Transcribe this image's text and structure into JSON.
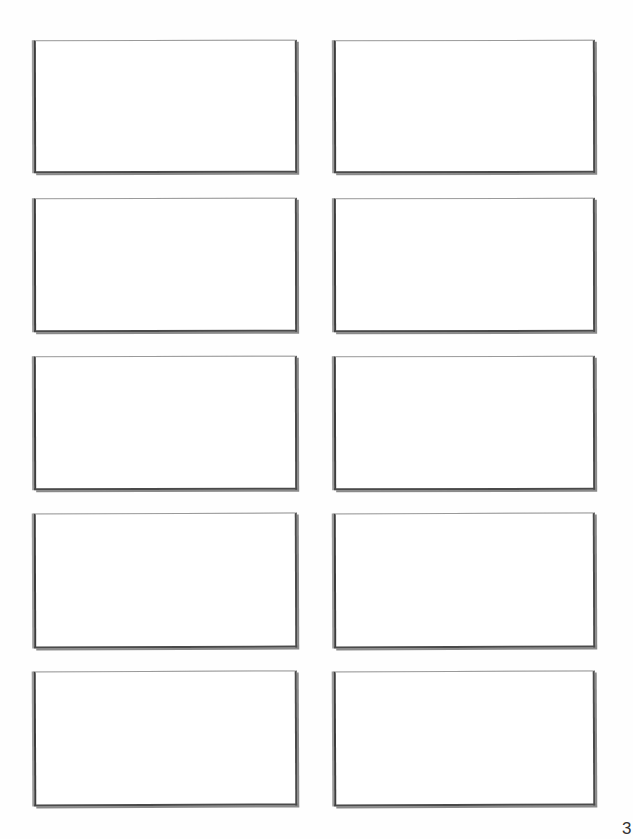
{
  "document": {
    "page_number": "3",
    "layout": {
      "columns": 2,
      "rows": 5
    },
    "cards": [
      {
        "row": 1,
        "column": "left",
        "content": ""
      },
      {
        "row": 1,
        "column": "right",
        "content": ""
      },
      {
        "row": 2,
        "column": "left",
        "content": ""
      },
      {
        "row": 2,
        "column": "right",
        "content": ""
      },
      {
        "row": 3,
        "column": "left",
        "content": ""
      },
      {
        "row": 3,
        "column": "right",
        "content": ""
      },
      {
        "row": 4,
        "column": "left",
        "content": ""
      },
      {
        "row": 4,
        "column": "right",
        "content": ""
      },
      {
        "row": 5,
        "column": "left",
        "content": ""
      },
      {
        "row": 5,
        "column": "right",
        "content": ""
      }
    ],
    "colors": {
      "paper": "#ffffff",
      "frame_edge": "#3c3c3c",
      "frame_top": "#9a9a9a",
      "text": "#333333"
    }
  }
}
